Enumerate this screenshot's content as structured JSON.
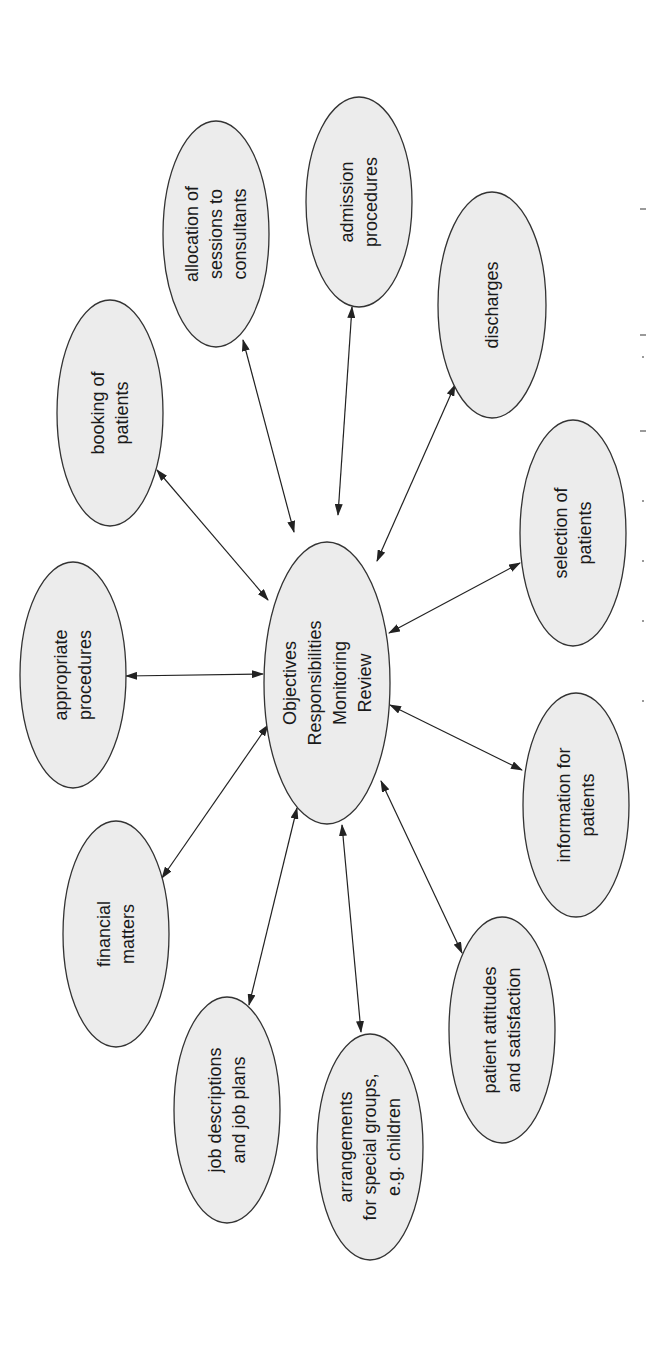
{
  "diagram": {
    "orientation": "rotated -90 degrees (text reads bottom-to-top)",
    "center": {
      "id": "center",
      "lines": [
        "Objectives",
        "Responsibilities",
        "Monitoring",
        "Review"
      ],
      "cx": 327,
      "cy": 683,
      "rx": 63,
      "ry": 141
    },
    "nodes": [
      {
        "id": "appropriate-procedures",
        "lines": [
          "appropriate",
          "procedures"
        ],
        "cx": 73,
        "cy": 675,
        "rx": 53,
        "ry": 113
      },
      {
        "id": "booking-of-patients",
        "lines": [
          "booking of",
          "patients"
        ],
        "cx": 110,
        "cy": 413,
        "rx": 53,
        "ry": 113
      },
      {
        "id": "allocation-of-sessions",
        "lines": [
          "allocation of",
          "sessions to",
          "consultants"
        ],
        "cx": 216,
        "cy": 234,
        "rx": 53,
        "ry": 113
      },
      {
        "id": "admission-procedures",
        "lines": [
          "admission",
          "procedures"
        ],
        "cx": 359,
        "cy": 202,
        "rx": 53,
        "ry": 105
      },
      {
        "id": "discharges",
        "lines": [
          "discharges"
        ],
        "cx": 492,
        "cy": 305,
        "rx": 54,
        "ry": 113
      },
      {
        "id": "selection-of-patients",
        "lines": [
          "selection of",
          "patients"
        ],
        "cx": 573,
        "cy": 533,
        "rx": 53,
        "ry": 113
      },
      {
        "id": "information-for-patients",
        "lines": [
          "information for",
          "patients"
        ],
        "cx": 576,
        "cy": 805,
        "rx": 53,
        "ry": 112
      },
      {
        "id": "patient-attitudes",
        "lines": [
          "patient attitudes",
          "and satisfaction"
        ],
        "cx": 502,
        "cy": 1030,
        "rx": 53,
        "ry": 113
      },
      {
        "id": "arrangements-special-groups",
        "lines": [
          "arrangements",
          "for special groups,",
          "e.g. children"
        ],
        "cx": 370,
        "cy": 1147,
        "rx": 53,
        "ry": 113
      },
      {
        "id": "job-descriptions",
        "lines": [
          "job descriptions",
          "and job plans"
        ],
        "cx": 227,
        "cy": 1110,
        "rx": 53,
        "ry": 113
      },
      {
        "id": "financial-matters",
        "lines": [
          "financial",
          "matters"
        ],
        "cx": 116,
        "cy": 934,
        "rx": 53,
        "ry": 113
      }
    ],
    "edges": [
      {
        "to": "appropriate-procedures",
        "x1": 126,
        "y1": 676,
        "x2": 263,
        "y2": 674,
        "arrows": "both"
      },
      {
        "to": "booking-of-patients",
        "x1": 157,
        "y1": 470,
        "x2": 268,
        "y2": 600,
        "arrows": "both"
      },
      {
        "to": "allocation-of-sessions",
        "x1": 243,
        "y1": 340,
        "x2": 294,
        "y2": 532,
        "arrows": "both"
      },
      {
        "to": "admission-procedures",
        "x1": 352,
        "y1": 307,
        "x2": 338,
        "y2": 515,
        "arrows": "both"
      },
      {
        "to": "discharges",
        "x1": 455,
        "y1": 385,
        "x2": 377,
        "y2": 561,
        "arrows": "both"
      },
      {
        "to": "selection-of-patients",
        "x1": 520,
        "y1": 563,
        "x2": 389,
        "y2": 633,
        "arrows": "both"
      },
      {
        "to": "information-for-patients",
        "x1": 522,
        "y1": 770,
        "x2": 390,
        "y2": 705,
        "arrows": "both"
      },
      {
        "to": "patient-attitudes",
        "x1": 462,
        "y1": 953,
        "x2": 381,
        "y2": 781,
        "arrows": "both"
      },
      {
        "to": "arrangements-special-groups",
        "x1": 361,
        "y1": 1032,
        "x2": 342,
        "y2": 825,
        "arrows": "both"
      },
      {
        "to": "job-descriptions",
        "x1": 249,
        "y1": 1005,
        "x2": 297,
        "y2": 808,
        "arrows": "both"
      },
      {
        "to": "financial-matters",
        "x1": 162,
        "y1": 878,
        "x2": 268,
        "y2": 725,
        "arrows": "both"
      }
    ],
    "style": {
      "node_fill": "#ececec",
      "node_stroke": "#333333",
      "edge_color": "#222222",
      "background": "#ffffff"
    }
  }
}
